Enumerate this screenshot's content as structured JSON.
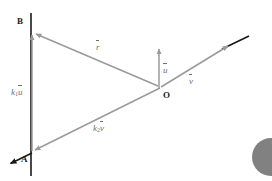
{
  "figure": {
    "background_color": "#ffffff",
    "width": 272,
    "height": 181
  },
  "colors": {
    "vector_gray": "#9a9a9a",
    "line_dark": "#1a1a1a",
    "label_gray": "#6f6f6f",
    "point_label": "#1a1a1a",
    "blob_gray": "#6b6b6b"
  },
  "points": [
    {
      "id": "B",
      "label": "B",
      "x": 32,
      "y": 33
    },
    {
      "id": "A",
      "label": "A",
      "x": 32,
      "y": 152
    },
    {
      "id": "O",
      "label": "O",
      "x": 161,
      "y": 88
    }
  ],
  "vectors": [
    {
      "id": "r",
      "label": "r",
      "accent": "arrow-over",
      "from": "O",
      "to": "B",
      "color": "#9a9a9a",
      "label_x": 96,
      "label_y": 43
    },
    {
      "id": "u",
      "label": "u",
      "accent": "arrow-over",
      "from": "O",
      "to": "up",
      "color": "#9a9a9a",
      "label_x": 163,
      "label_y": 66
    },
    {
      "id": "v",
      "label": "v",
      "accent": "arrow-over",
      "from": "O",
      "to": "up-right",
      "color": "#9a9a9a",
      "label_x": 189,
      "label_y": 77
    },
    {
      "id": "k1u",
      "label": "k",
      "subscript": "1",
      "label_tail": "u",
      "accent": "arrow-over",
      "from": "A",
      "to": "B",
      "color": "#9a9a9a",
      "label_x": 11,
      "label_y": 88
    },
    {
      "id": "k2v",
      "label": "k",
      "subscript": "2",
      "label_tail": "v",
      "accent": "arrow-over",
      "from": "O",
      "to": "A",
      "color": "#9a9a9a",
      "label_x": 93,
      "label_y": 124
    }
  ],
  "lines": [
    {
      "id": "vertical-line",
      "description": "vertical line through A and B",
      "color": "#1a1a1a",
      "x1": 31,
      "y1": 13,
      "x2": 31,
      "y2": 176
    },
    {
      "id": "oblique-line",
      "description": "oblique line through A and O extended",
      "color": "#1a1a1a",
      "x1": 10,
      "y1": 158,
      "x2": 249,
      "y2": 37
    }
  ],
  "decoration": {
    "corner_blob": {
      "id": "corner-blob",
      "description": "partially cropped dark circle at lower-right edge"
    }
  }
}
